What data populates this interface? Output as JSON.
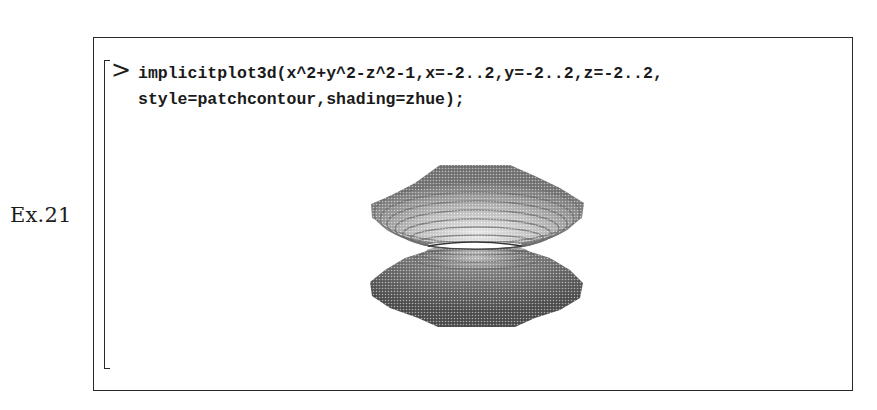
{
  "example": {
    "label": "Ex.21"
  },
  "worksheet": {
    "prompt": ">",
    "input": {
      "line1": "implicitplot3d(x^2+y^2-z^2-1,x=-2..2,y=-2..2,z=-2..2,",
      "line2": "style=patchcontour,shading=zhue);"
    },
    "output": {
      "type": "3d-plot",
      "description": "Implicit 3D surface of a hyperboloid of one sheet rendered with patchcontour style and zhue shading",
      "surface_icon": "hyperboloid-plot"
    }
  }
}
